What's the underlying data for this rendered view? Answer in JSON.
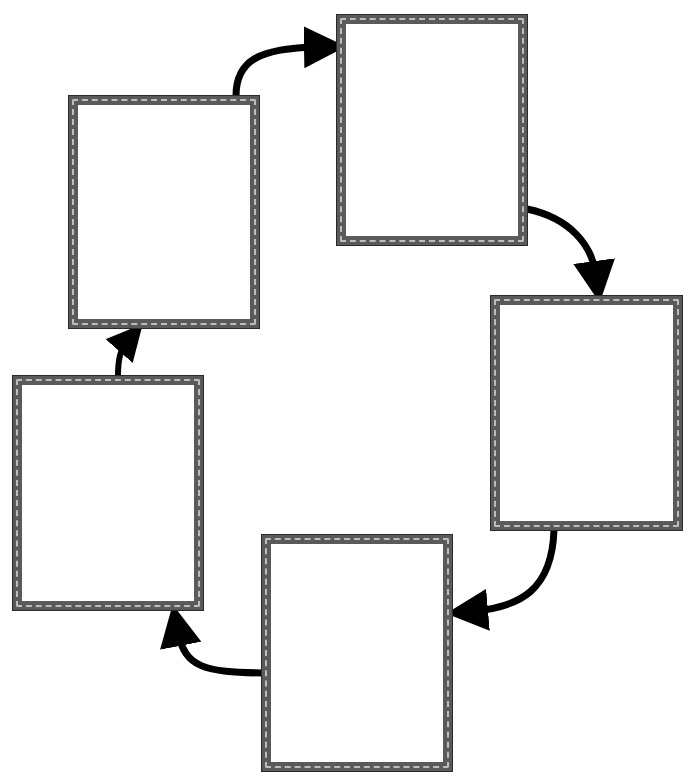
{
  "diagram": {
    "type": "cycle",
    "frame_style": {
      "border_color": "#5a5a5a",
      "wave_color": "#bdbdbd",
      "fill": "#ffffff"
    },
    "arrow_color": "#000000",
    "boxes": [
      {
        "id": "box-1",
        "label": "",
        "x": 69,
        "y": 96,
        "w": 190,
        "h": 232
      },
      {
        "id": "box-2",
        "label": "",
        "x": 337,
        "y": 15,
        "w": 190,
        "h": 230
      },
      {
        "id": "box-3",
        "label": "",
        "x": 491,
        "y": 296,
        "w": 191,
        "h": 234
      },
      {
        "id": "box-4",
        "label": "",
        "x": 262,
        "y": 535,
        "w": 190,
        "h": 236
      },
      {
        "id": "box-5",
        "label": "",
        "x": 13,
        "y": 376,
        "w": 190,
        "h": 234
      }
    ],
    "arrows": [
      {
        "from": "box-1",
        "to": "box-2"
      },
      {
        "from": "box-2",
        "to": "box-3"
      },
      {
        "from": "box-3",
        "to": "box-4"
      },
      {
        "from": "box-4",
        "to": "box-5"
      },
      {
        "from": "box-5",
        "to": "box-1"
      }
    ]
  }
}
